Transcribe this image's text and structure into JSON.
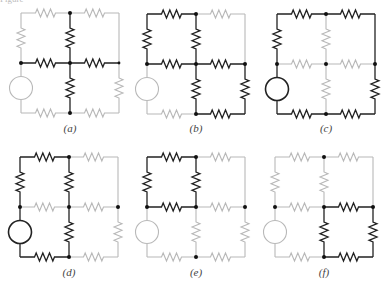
{
  "figure": {
    "title_cropped": "Figure",
    "colors": {
      "active": "#222222",
      "inactive": "#b8b8b8",
      "node": "#111111",
      "background": "#ffffff"
    },
    "grid": {
      "col_offsets": [
        0,
        49,
        98
      ],
      "row_offsets": [
        0,
        50,
        100
      ]
    },
    "panels": [
      {
        "id": "a",
        "label": "(a)",
        "x": 21,
        "y": 13,
        "label_y": 122,
        "active": [
          "MU",
          "ML",
          "HL",
          "HR"
        ],
        "nodes": [
          "TM",
          "LM",
          "C",
          "BM",
          "RM"
        ]
      },
      {
        "id": "b",
        "label": "(b)",
        "x": 147,
        "y": 14,
        "label_y": 122,
        "active": [
          "TL",
          "LU",
          "MU",
          "HL",
          "HR",
          "ML",
          "RL",
          "BR"
        ],
        "nodes": [
          "TM",
          "LM",
          "C",
          "RM",
          "BM"
        ]
      },
      {
        "id": "c",
        "label": "(c)",
        "x": 277,
        "y": 14,
        "label_y": 122,
        "active": [
          "TL",
          "TR",
          "LU",
          "SRC",
          "RU",
          "RL",
          "BL",
          "BR"
        ],
        "nodes": [
          "TM",
          "LM",
          "C",
          "RM",
          "BM"
        ]
      },
      {
        "id": "d",
        "label": "(d)",
        "x": 20,
        "y": 157,
        "label_y": 266,
        "active": [
          "TL",
          "LU",
          "SRC",
          "MU",
          "ML",
          "BL"
        ],
        "nodes": [
          "TM",
          "LM",
          "C",
          "RM",
          "BM"
        ]
      },
      {
        "id": "e",
        "label": "(e)",
        "x": 147,
        "y": 157,
        "label_y": 266,
        "active": [
          "TL",
          "LU",
          "MU",
          "HL"
        ],
        "nodes": [
          "TM",
          "LM",
          "C",
          "RM",
          "BM"
        ]
      },
      {
        "id": "f",
        "label": "(f)",
        "x": 275,
        "y": 157,
        "label_y": 266,
        "active": [
          "HR",
          "ML",
          "RL",
          "BR"
        ],
        "nodes": [
          "TM",
          "LM",
          "C",
          "RM",
          "BM"
        ]
      }
    ],
    "elements": {
      "TL": {
        "type": "resistor",
        "orient": "h",
        "from": [
          0,
          0
        ],
        "to": [
          1,
          0
        ]
      },
      "TR": {
        "type": "resistor",
        "orient": "h",
        "from": [
          1,
          0
        ],
        "to": [
          2,
          0
        ]
      },
      "LU": {
        "type": "resistor",
        "orient": "v",
        "from": [
          0,
          0
        ],
        "to": [
          0,
          1
        ]
      },
      "SRC": {
        "type": "source",
        "orient": "v",
        "from": [
          0,
          1
        ],
        "to": [
          0,
          2
        ]
      },
      "MU": {
        "type": "resistor",
        "orient": "v",
        "from": [
          1,
          0
        ],
        "to": [
          1,
          1
        ]
      },
      "ML": {
        "type": "resistor",
        "orient": "v",
        "from": [
          1,
          1
        ],
        "to": [
          1,
          2
        ]
      },
      "RU": {
        "type": "wire",
        "orient": "v",
        "from": [
          2,
          0
        ],
        "to": [
          2,
          1
        ]
      },
      "RL": {
        "type": "resistor",
        "orient": "v",
        "from": [
          2,
          1
        ],
        "to": [
          2,
          2
        ]
      },
      "HL": {
        "type": "resistor",
        "orient": "h",
        "from": [
          0,
          1
        ],
        "to": [
          1,
          1
        ]
      },
      "HR": {
        "type": "resistor",
        "orient": "h",
        "from": [
          1,
          1
        ],
        "to": [
          2,
          1
        ]
      },
      "BL": {
        "type": "resistor",
        "orient": "h",
        "from": [
          0,
          2
        ],
        "to": [
          1,
          2
        ]
      },
      "BR": {
        "type": "resistor",
        "orient": "h",
        "from": [
          1,
          2
        ],
        "to": [
          2,
          2
        ]
      }
    },
    "node_positions": {
      "TM": [
        1,
        0
      ],
      "LM": [
        0,
        1
      ],
      "C": [
        1,
        1
      ],
      "RM": [
        2,
        1
      ],
      "BM": [
        1,
        2
      ]
    }
  }
}
